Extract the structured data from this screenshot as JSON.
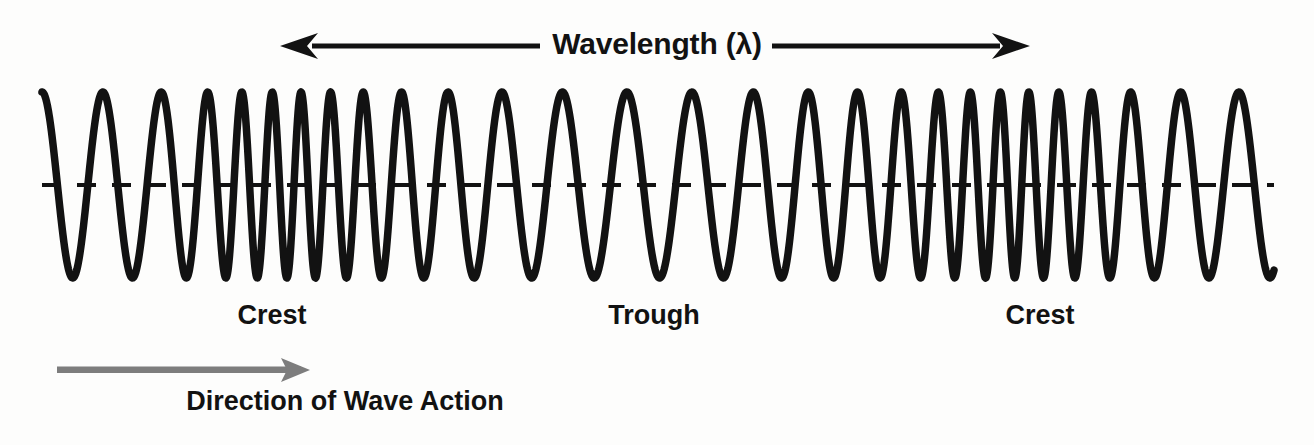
{
  "diagram": {
    "title": "Wavelength (λ)",
    "background_color": "#fdfdfc",
    "wave_color": "#121212",
    "axis_color": "#121212",
    "direction_arrow_color": "#7d7d7d"
  },
  "wavelength_arrow": {
    "label": "Wavelength (λ)",
    "style": "double-headed",
    "left_arrow_tip_x": 280,
    "right_arrow_tip_x": 1030,
    "line_y": 46
  },
  "wave_labels": [
    {
      "text": "Crest",
      "x": 272,
      "y": 300
    },
    {
      "text": "Trough",
      "x": 654,
      "y": 300
    },
    {
      "text": "Crest",
      "x": 1040,
      "y": 300
    }
  ],
  "direction_arrow": {
    "label": "Direction of Wave Action",
    "style": "single-headed-right",
    "color": "#7d7d7d",
    "start_x": 57,
    "tip_x": 310,
    "line_y": 370
  },
  "chart_data": {
    "type": "line",
    "title": "Wavelength (λ)",
    "xlabel": "Direction of Wave Action",
    "ylabel": "",
    "grid": false,
    "legend": null,
    "annotations": [
      {
        "text": "Wavelength (λ)",
        "position": "top-center"
      },
      {
        "text": "Crest",
        "position": "below-wave-left"
      },
      {
        "text": "Trough",
        "position": "below-wave-center"
      },
      {
        "text": "Crest",
        "position": "below-wave-right"
      },
      {
        "text": "Direction of Wave Action",
        "position": "bottom-left"
      }
    ],
    "axis": {
      "centerline_y": 185,
      "centerline_style": "dashed",
      "x_start": 42,
      "x_end": 1274
    },
    "wave": {
      "amplitude": 93,
      "peak_y": 92,
      "trough_y": 278,
      "description": "Longitudinal-style wave whose local frequency varies: dense compressions under the Crest labels and sparse rarefactions under the Trough label.",
      "frequency_profile": [
        {
          "x": 42,
          "period": 62
        },
        {
          "x": 150,
          "period": 58
        },
        {
          "x": 230,
          "period": 32
        },
        {
          "x": 300,
          "period": 28
        },
        {
          "x": 360,
          "period": 34
        },
        {
          "x": 430,
          "period": 48
        },
        {
          "x": 520,
          "period": 60
        },
        {
          "x": 620,
          "period": 66
        },
        {
          "x": 700,
          "period": 64
        },
        {
          "x": 790,
          "period": 54
        },
        {
          "x": 880,
          "period": 44
        },
        {
          "x": 950,
          "period": 32
        },
        {
          "x": 1020,
          "period": 28
        },
        {
          "x": 1090,
          "period": 34
        },
        {
          "x": 1160,
          "period": 52
        },
        {
          "x": 1240,
          "period": 62
        },
        {
          "x": 1274,
          "period": 62
        }
      ]
    }
  }
}
